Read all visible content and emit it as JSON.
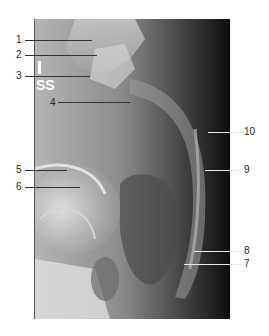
{
  "figure": {
    "type": "radiograph",
    "marker_text": "SS",
    "labels": [
      {
        "id": "1",
        "text": "1"
      },
      {
        "id": "2",
        "text": "2"
      },
      {
        "id": "3",
        "text": "3"
      },
      {
        "id": "4",
        "text": "4"
      },
      {
        "id": "5",
        "text": "5"
      },
      {
        "id": "6",
        "text": "6"
      },
      {
        "id": "7",
        "text": "7"
      },
      {
        "id": "8",
        "text": "8"
      },
      {
        "id": "9",
        "text": "9"
      },
      {
        "id": "10",
        "text": "10"
      }
    ]
  }
}
